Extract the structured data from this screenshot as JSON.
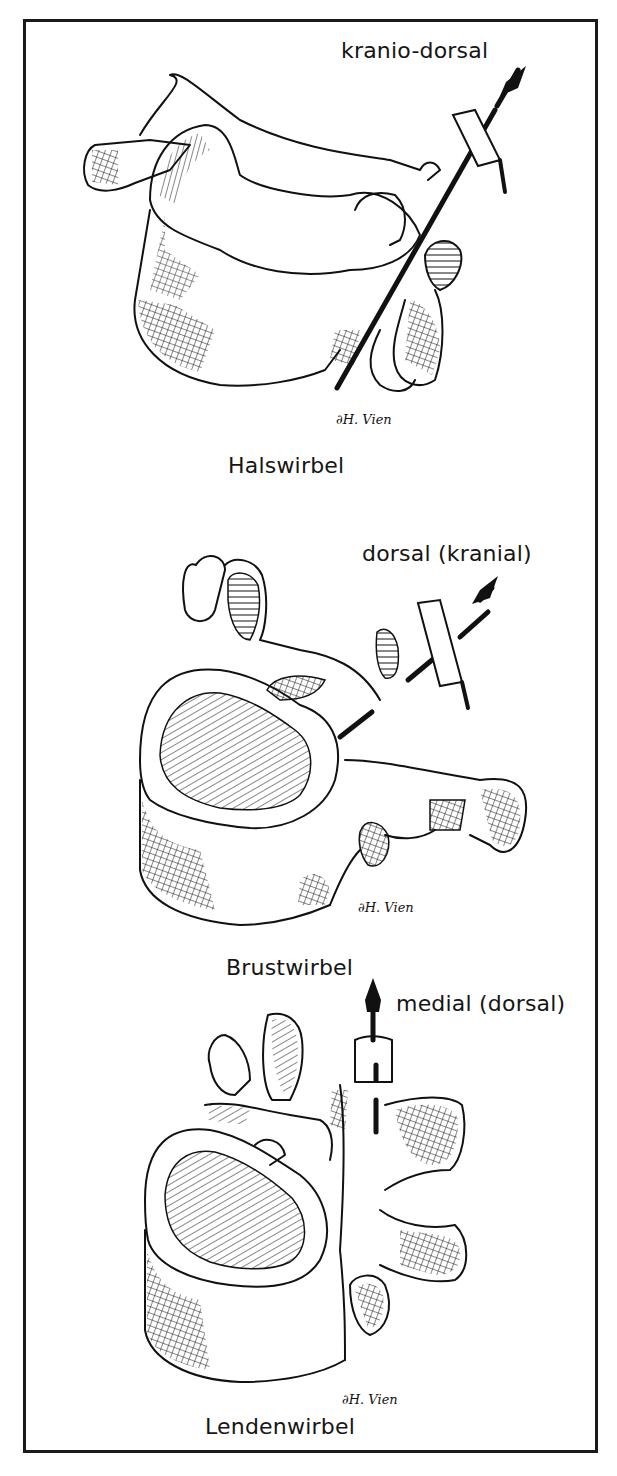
{
  "figure": {
    "panels": [
      {
        "name": "Halswirbel",
        "title": "Halswirbel",
        "direction_label": "kranio-dorsal",
        "signature": "∂H. Vien"
      },
      {
        "name": "Brustwirbel",
        "title": "Brustwirbel",
        "direction_label": "dorsal (kranial)",
        "signature": "∂H. Vien"
      },
      {
        "name": "Lendenwirbel",
        "title": "Lendenwirbel",
        "direction_label": "medial (dorsal)",
        "signature": "∂H. Vien"
      }
    ]
  },
  "colors": {
    "ink": "#111111",
    "background": "#ffffff",
    "frame": "#1a1a1a"
  }
}
